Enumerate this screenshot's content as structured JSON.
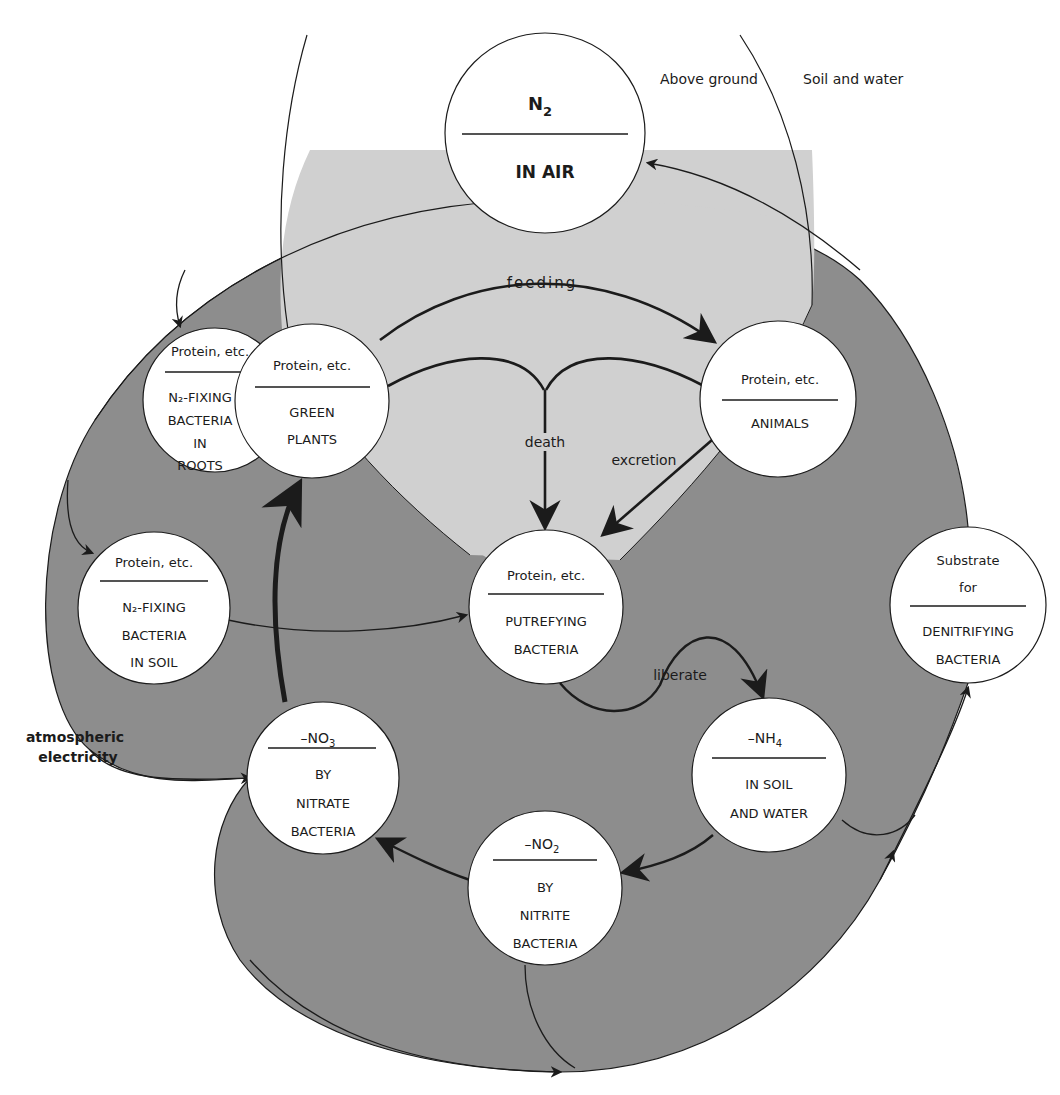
{
  "colors": {
    "background": "#ffffff",
    "soil_region": "#8d8d8d",
    "above_ground_region": "#d0d0d0",
    "node_fill": "#ffffff",
    "line": "#1b1b1b"
  },
  "region_labels": {
    "above_ground": "Above ground",
    "soil_and_water": "Soil and water"
  },
  "nodes": {
    "n2_air": {
      "top": "N",
      "top_sub": "2",
      "bottom": [
        "IN AIR"
      ]
    },
    "roots_bacteria": {
      "top": "Protein, etc.",
      "bottom": [
        "N₂-FIXING",
        "BACTERIA",
        "IN",
        "ROOTS"
      ]
    },
    "green_plants": {
      "top": "Protein, etc.",
      "bottom": [
        "GREEN",
        "PLANTS"
      ]
    },
    "animals": {
      "top": "Protein, etc.",
      "bottom": [
        "ANIMALS"
      ]
    },
    "soil_bacteria": {
      "top": "Protein, etc.",
      "bottom": [
        "N₂-FIXING",
        "BACTERIA",
        "IN SOIL"
      ]
    },
    "putrefying": {
      "top": "Protein, etc.",
      "bottom": [
        "PUTREFYING",
        "BACTERIA"
      ]
    },
    "denitrifying": {
      "top": [
        "Substrate",
        "for"
      ],
      "bottom": [
        "DENITRIFYING",
        "BACTERIA"
      ]
    },
    "nitrate": {
      "top": "–NO",
      "top_sub": "3",
      "bottom": [
        "BY",
        "NITRATE",
        "BACTERIA"
      ]
    },
    "ammonium": {
      "top": "–NH",
      "top_sub": "4",
      "bottom": [
        "IN SOIL",
        "AND WATER"
      ]
    },
    "nitrite": {
      "top": "–NO",
      "top_sub": "2",
      "bottom": [
        "BY",
        "NITRITE",
        "BACTERIA"
      ]
    }
  },
  "edge_labels": {
    "feeding": "feeding",
    "death": "death",
    "excretion": "excretion",
    "liberate": "liberate",
    "atmospheric_1": "atmospheric",
    "atmospheric_2": "electricity"
  }
}
